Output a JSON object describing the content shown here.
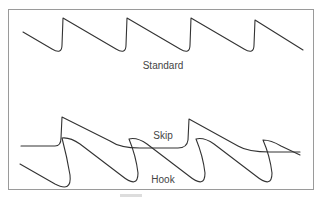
{
  "diagram": {
    "waveforms": [
      {
        "name": "Standard",
        "label": "Standard"
      },
      {
        "name": "Skip",
        "label": "Skip"
      },
      {
        "name": "Hook",
        "label": "Hook"
      }
    ],
    "colors": {
      "stroke": "#333333",
      "frame": "#9a9a9a",
      "text": "#444444"
    }
  }
}
